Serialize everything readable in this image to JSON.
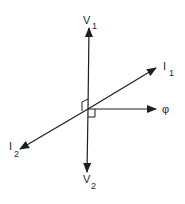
{
  "diagram": {
    "type": "phasor-vector-diagram",
    "line_color": "#1e1e1e",
    "vectors": [
      {
        "id": "V1",
        "label": "V",
        "subscript": "1",
        "direction": "up"
      },
      {
        "id": "V2",
        "label": "V",
        "subscript": "2",
        "direction": "down"
      },
      {
        "id": "I1",
        "label": "I",
        "subscript": "1",
        "direction": "upper-right"
      },
      {
        "id": "I2",
        "label": "I",
        "subscript": "2",
        "direction": "lower-left"
      },
      {
        "id": "phi",
        "label": "φ",
        "subscript": "",
        "direction": "right"
      }
    ],
    "right_angle_markers": [
      {
        "between": [
          "V1",
          "I1"
        ],
        "position": "upper-left of origin"
      },
      {
        "between": [
          "V2",
          "phi"
        ],
        "position": "lower-right of origin"
      }
    ]
  }
}
